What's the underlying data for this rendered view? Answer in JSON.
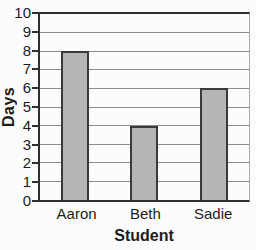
{
  "chart_data": {
    "type": "bar",
    "title": "",
    "categories": [
      "Aaron",
      "Beth",
      "Sadie"
    ],
    "values": [
      8,
      4,
      6
    ],
    "xlabel": "Student",
    "ylabel": "Days",
    "ylim": [
      0,
      10
    ],
    "ytick_step": 1,
    "yticks": [
      0,
      1,
      2,
      3,
      4,
      5,
      6,
      7,
      8,
      9,
      10
    ],
    "grid": true,
    "legend": false,
    "colors": {
      "background": "#fcfcfc",
      "bar_fill": "#b5b5b5",
      "bar_border": "#3a3a3a",
      "gridline": "#8d8d8d",
      "axis": "#2f2f2f",
      "plot_right_border": "#a8a8a8",
      "text": "#1c1c1c"
    }
  }
}
